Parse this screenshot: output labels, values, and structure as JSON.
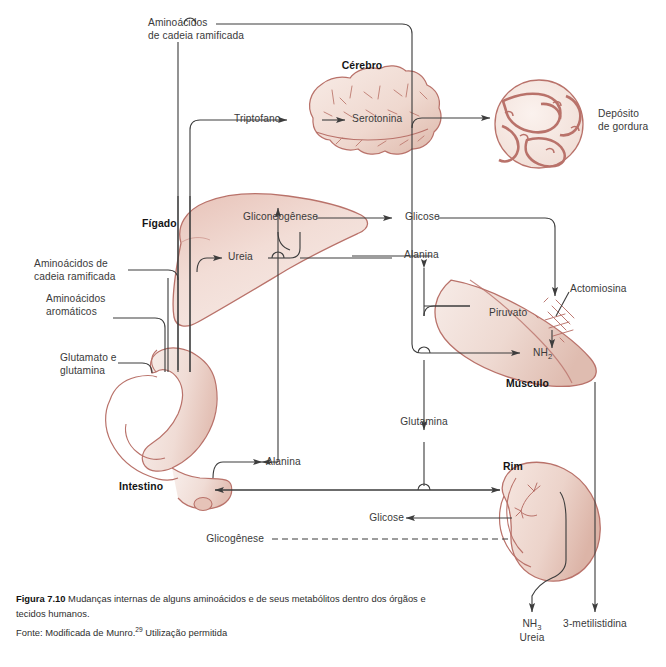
{
  "figure": {
    "number": "Figura 7.10",
    "caption": " Mudanças internas de alguns aminoácidos e de seus metabólitos dentro dos órgãos e tecidos humanos.",
    "source_prefix": "Fonte: Modificada de Munro.",
    "source_ref": "29",
    "source_suffix": " Utilização permitida"
  },
  "organs": {
    "brain": "Cérebro",
    "fat_deposit_line1": "Depósito",
    "fat_deposit_line2": "de gordura",
    "liver": "Fígado",
    "muscle": "Músculo",
    "kidney": "Rim",
    "intestine": "Intestino"
  },
  "inputs": {
    "branched_chain_line1": "Aminoácidos",
    "branched_chain_line2": "de cadeia ramificada",
    "branched_chain_left_line1": "Aminoácidos de",
    "branched_chain_left_line2": "cadeia ramificada",
    "aromatic_line1": "Aminoácidos",
    "aromatic_line2": "aromáticos",
    "glutamate_line1": "Glutamato e",
    "glutamate_line2": "glutamina"
  },
  "metabolites": {
    "tryptophan": "Triptofano",
    "serotonin": "Serotonina",
    "gluconeogenesis": "Gliconeogênese",
    "glucose_liver": "Glicose",
    "urea_liver": "Ureia",
    "alanine_right": "Alanina",
    "pyruvate": "Piruvato",
    "actomyosin": "Actomiosina",
    "ammonia_muscle_main": "NH",
    "ammonia_muscle_sub": "2",
    "glutamine": "Glutamina",
    "alanine_gut": "Alanina",
    "glucose_kidney": "Glicose",
    "glycogenesis": "Glicogênese",
    "ammonia_out_main": "NH",
    "ammonia_out_sub": "3",
    "urea_out": "Ureia",
    "methylhistidine": "3-metilistidina"
  },
  "colors": {
    "tissue_outline": "#b9726a",
    "tissue_fill_light": "#f4e6e1",
    "tissue_fill_mid": "#eed7cf",
    "tissue_fill_deep": "#e2bdb2",
    "flow_line": "#3d3d3d",
    "text": "#3a3a3a",
    "background": "#ffffff"
  }
}
